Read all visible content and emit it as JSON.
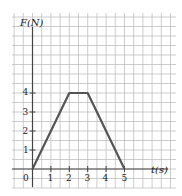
{
  "chart_data": {
    "type": "line",
    "title": "",
    "xlabel": "t(s)",
    "ylabel": "F(N)",
    "x": [
      0,
      2,
      3,
      5
    ],
    "series": [
      {
        "name": "F(t)",
        "values": [
          0,
          4,
          4,
          0
        ]
      }
    ],
    "x_ticks": [
      "0",
      "1",
      "2",
      "3",
      "4",
      "5"
    ],
    "y_ticks": [
      "1",
      "2",
      "3",
      "4"
    ],
    "xlim": [
      -1,
      7.6
    ],
    "ylim": [
      -1,
      8.4
    ],
    "grid": true,
    "grid_cell": 0.5,
    "legend": "none"
  },
  "labels": {
    "y_axis": "F(N)",
    "x_axis": "t(s)",
    "origin": "0",
    "x1": "1",
    "x2": "2",
    "x3": "3",
    "x4": "4",
    "x5": "5",
    "y1": "1",
    "y2": "2",
    "y3": "3",
    "y4": "4"
  },
  "colors": {
    "grid": "#b8b8b8",
    "axis": "#444444",
    "curve": "#555555",
    "text": "#222222"
  }
}
